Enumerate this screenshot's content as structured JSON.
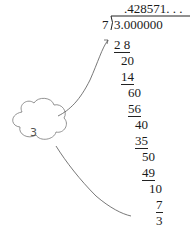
{
  "division": {
    "quotient": ".428571. . .",
    "divisor": "7",
    "dividend": "3.000000",
    "steps": [
      {
        "value": "2 8",
        "underlined": true
      },
      {
        "value": "20",
        "underlined": false
      },
      {
        "value": "14",
        "underlined": true
      },
      {
        "value": "60",
        "underlined": false
      },
      {
        "value": "56",
        "underlined": true
      },
      {
        "value": "40",
        "underlined": false
      },
      {
        "value": "35",
        "underlined": true
      },
      {
        "value": "50",
        "underlined": false
      },
      {
        "value": "49",
        "underlined": true
      },
      {
        "value": "10",
        "underlined": false
      },
      {
        "value": "7",
        "underlined": true
      },
      {
        "value": "3",
        "underlined": false
      }
    ]
  },
  "cloud": {
    "label": "3"
  }
}
